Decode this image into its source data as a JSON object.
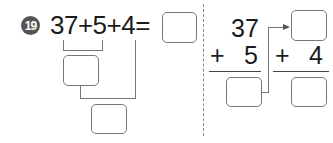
{
  "problem": {
    "number": "19",
    "expression": "37+5+4=",
    "vertical_left": {
      "top": "37",
      "op": "+",
      "operand": "5"
    },
    "vertical_right": {
      "op": "+",
      "operand": "4"
    }
  },
  "answer_boxes": [
    {
      "id": "final-answer",
      "value": ""
    },
    {
      "id": "partial-sum-1",
      "value": ""
    },
    {
      "id": "partial-sum-2",
      "value": ""
    },
    {
      "id": "vertical-sum-1",
      "value": ""
    },
    {
      "id": "vertical-carry-box",
      "value": ""
    },
    {
      "id": "vertical-sum-2",
      "value": ""
    }
  ],
  "colors": {
    "badge": "#555555",
    "line": "#777777",
    "text": "#1a1a1a"
  }
}
